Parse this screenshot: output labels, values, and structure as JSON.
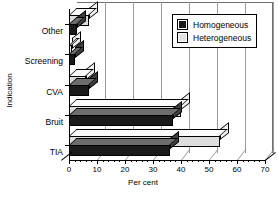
{
  "chart_data": {
    "type": "bar",
    "orientation": "horizontal",
    "title": "",
    "xlabel": "Per cent",
    "ylabel": "Indication",
    "xlim": [
      0,
      70
    ],
    "xticks": [
      0,
      10,
      20,
      30,
      40,
      50,
      60,
      70
    ],
    "xtick_labels": [
      "0",
      "10",
      "20",
      "30",
      "40",
      "50",
      "60",
      "70"
    ],
    "minor_tick_step": 2,
    "grid": true,
    "legend_position": "top-right-inside",
    "categories": [
      "Other",
      "Screening",
      "CVA",
      "Bruit",
      "TIA"
    ],
    "series": [
      {
        "name": "Homogeneous",
        "color": "#1a1a1a",
        "values": [
          3,
          2,
          7,
          37,
          36
        ]
      },
      {
        "name": "Heterogeneous",
        "color": "#dcdcdc",
        "values": [
          7,
          1,
          6,
          40,
          54
        ]
      }
    ]
  },
  "legend": {
    "items": [
      {
        "label": "Homogeneous"
      },
      {
        "label": "Heterogeneous"
      }
    ]
  }
}
